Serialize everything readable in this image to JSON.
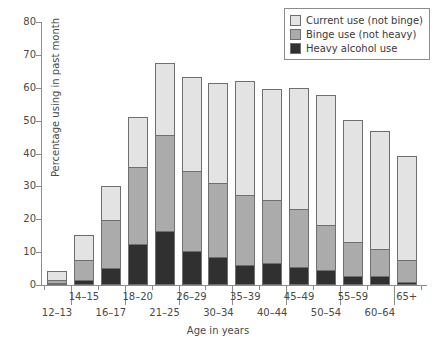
{
  "chart_data": {
    "type": "bar",
    "subtype": "stacked",
    "title": "",
    "xlabel": "Age in years",
    "ylabel": "Percentage using in past month",
    "ylim": [
      0,
      80
    ],
    "yticks": [
      0,
      10,
      20,
      30,
      40,
      50,
      60,
      70,
      80
    ],
    "grid": false,
    "legend_position": "top-right",
    "categories": [
      "12–13",
      "14–15",
      "16–17",
      "18–20",
      "21–25",
      "26–29",
      "30–34",
      "35–39",
      "40–44",
      "45–49",
      "50–54",
      "55–59",
      "60–64",
      "65+"
    ],
    "series": [
      {
        "name": "Heavy alcohol use",
        "color": "#303030",
        "values": [
          0.5,
          1.5,
          5.2,
          12.6,
          16.5,
          10.2,
          8.5,
          6.2,
          6.7,
          5.5,
          4.7,
          2.7,
          2.6,
          1.0
        ]
      },
      {
        "name": "Binge use (not heavy)",
        "color": "#ababab",
        "values": [
          1.0,
          6.0,
          14.5,
          23.3,
          29.0,
          24.5,
          22.4,
          21.1,
          19.2,
          17.6,
          13.7,
          10.3,
          8.5,
          6.5
        ]
      },
      {
        "name": "Current use (not binge)",
        "color": "#e3e3e3",
        "values": [
          2.8,
          7.8,
          10.3,
          15.2,
          21.9,
          28.6,
          30.5,
          34.9,
          33.8,
          36.9,
          39.4,
          37.2,
          35.6,
          31.6
        ]
      }
    ],
    "totals": [
      4.3,
      15.3,
      30.0,
      51.1,
      67.4,
      63.3,
      61.4,
      62.2,
      59.7,
      60.0,
      57.8,
      50.2,
      46.7,
      39.1
    ]
  },
  "legend": {
    "items": [
      {
        "label": "Current use (not binge)",
        "swatch": "#e3e3e3"
      },
      {
        "label": "Binge use (not heavy)",
        "swatch": "#ababab"
      },
      {
        "label": "Heavy alcohol use",
        "swatch": "#303030"
      }
    ]
  }
}
